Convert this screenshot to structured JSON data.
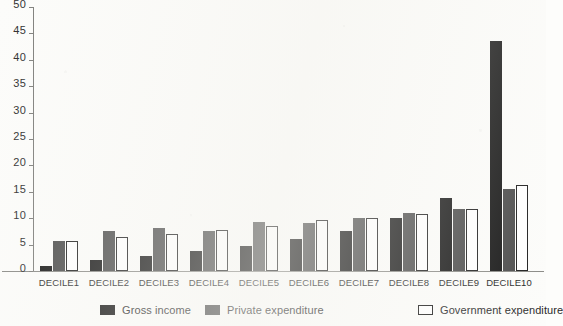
{
  "chart_data": {
    "type": "bar",
    "title": "",
    "subtitle": "",
    "xlabel": "",
    "ylabel": "",
    "ylim": [
      0,
      50
    ],
    "yticks": [
      0,
      5,
      10,
      15,
      20,
      25,
      30,
      35,
      40,
      45,
      50
    ],
    "grid": false,
    "legend_position": "bottom",
    "categories": [
      "DECILE1",
      "DECILE2",
      "DECILE3",
      "DECILE4",
      "DECILE5",
      "DECILE6",
      "DECILE7",
      "DECILE8",
      "DECILE9",
      "DECILE10"
    ],
    "series": [
      {
        "name": "Gross income",
        "color": "#151515",
        "values": [
          1.0,
          2.0,
          2.8,
          3.7,
          4.7,
          6.0,
          7.5,
          10.0,
          13.8,
          43.5
        ]
      },
      {
        "name": "Private expenditure",
        "color": "#4b4b4b",
        "values": [
          5.7,
          7.5,
          8.2,
          7.5,
          9.3,
          9.0,
          10.0,
          11.0,
          11.8,
          15.6
        ]
      },
      {
        "name": "Government expenditure",
        "color": "#ffffff",
        "values": [
          5.7,
          6.5,
          7.0,
          7.7,
          8.5,
          9.7,
          10.0,
          10.8,
          11.8,
          16.2
        ]
      }
    ]
  },
  "legend": {
    "items": [
      {
        "label": "Gross income",
        "swatch": "sw-gross"
      },
      {
        "label": "Private expenditure",
        "swatch": "sw-private"
      },
      {
        "label": "Government expenditure",
        "swatch": "sw-government"
      }
    ]
  },
  "colors": {
    "background": "#fcfcfa",
    "axis": "#7d7d7a",
    "text": "#2d2d2d",
    "gross_income": "#151515",
    "private_expenditure": "#4b4b4b",
    "government_expenditure": "#ffffff",
    "government_outline": "#1d1d1d"
  }
}
